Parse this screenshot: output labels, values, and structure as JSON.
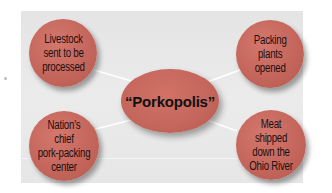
{
  "diagram": {
    "type": "concept-web",
    "center": {
      "label": "“Porkopolis”"
    },
    "nodes": [
      {
        "id": "top-left",
        "lines": [
          "Livestock",
          "sent to be",
          "processed"
        ]
      },
      {
        "id": "top-right",
        "lines": [
          "Packing",
          "plants",
          "opened"
        ]
      },
      {
        "id": "bottom-left",
        "lines": [
          "Nation's",
          "chief",
          "pork-packing",
          "center"
        ]
      },
      {
        "id": "bottom-right",
        "lines": [
          "Meat",
          "shipped",
          "down the",
          "Ohio River"
        ]
      }
    ],
    "colors": {
      "node_fill": "#c4665c",
      "panel_bg": "#e8e8e8",
      "connector": "#ffffff",
      "text": "#1a1010"
    }
  }
}
